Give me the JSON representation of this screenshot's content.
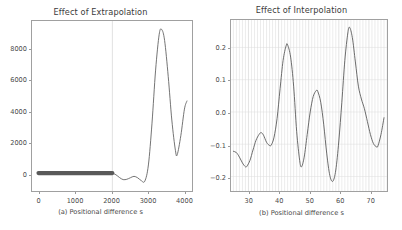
{
  "figure": {
    "background_color": "#ffffff",
    "axis_color": "#a0a0a0",
    "line_color": "#595959",
    "grid_color": "#d9d9d9",
    "panel_count": 2
  },
  "chart_data": [
    {
      "type": "line",
      "panel": "a",
      "title": "Effect of Extrapolation",
      "xlabel": "(a) Positional difference s",
      "ylabel": "",
      "xlim": [
        -180,
        4260
      ],
      "ylim": [
        -1150,
        9750
      ],
      "xticks": [
        0,
        1000,
        2000,
        3000,
        4000
      ],
      "xtick_labels": [
        "0",
        "1000",
        "2000",
        "3000",
        "4000"
      ],
      "yticks": [
        0,
        2000,
        4000,
        6000,
        8000
      ],
      "ytick_labels": [
        "0",
        "2000",
        "4000",
        "6000",
        "8000"
      ],
      "grid": "single vertical line at x=2050 marking train/extrapolation boundary",
      "gridlines_x": [
        2050
      ],
      "legend": "none",
      "annotations": [
        "thick flat band at y=0 from x=0 to x=2050 (training region, dense overlapping samples)",
        "extrapolation begins after x=2050: shallow negative ripple then steep blow-up"
      ],
      "x": [
        0,
        100,
        200,
        300,
        400,
        500,
        600,
        700,
        800,
        900,
        1000,
        1100,
        1200,
        1300,
        1400,
        1500,
        1600,
        1700,
        1800,
        1900,
        2000,
        2050,
        2150,
        2250,
        2350,
        2450,
        2550,
        2650,
        2750,
        2850,
        2950,
        3050,
        3150,
        3250,
        3350,
        3420,
        3500,
        3600,
        3700,
        3800,
        3850,
        3950,
        4050,
        4120
      ],
      "y": [
        0,
        0,
        0,
        0,
        0,
        0,
        0,
        0,
        0,
        0,
        0,
        0,
        0,
        0,
        0,
        0,
        0,
        0,
        0,
        0,
        0,
        0,
        -110,
        -290,
        -420,
        -400,
        -300,
        -210,
        -300,
        -480,
        -520,
        520,
        3200,
        6600,
        8900,
        9200,
        8500,
        6200,
        3400,
        1450,
        1180,
        2400,
        4100,
        4620
      ]
    },
    {
      "type": "line",
      "panel": "b",
      "title": "Effect of Interpolation",
      "xlabel": "(b) Positional difference s",
      "ylabel": "",
      "xlim": [
        24.2,
        76.0
      ],
      "ylim": [
        -0.245,
        0.285
      ],
      "xticks": [
        30,
        40,
        50,
        60,
        70
      ],
      "xtick_labels": [
        "30",
        "40",
        "50",
        "60",
        "70"
      ],
      "yticks": [
        -0.2,
        -0.1,
        0.0,
        0.1,
        0.2
      ],
      "ytick_labels": [
        "-0.2",
        "-0.1",
        "0.0",
        "0.1",
        "0.2"
      ],
      "grid": "dense vertical gridlines at every integer x (minor ticks)",
      "grid_spacing_x": 1,
      "legend": "none",
      "annotations": [
        "oscillating interpolation error curve",
        "major peaks near x=43 (0.21), x=52.5 (0.065), x=63.5 (0.26)",
        "major troughs near x=29.5 (-0.17), x=47.5 (-0.17), x=58 (-0.215)"
      ],
      "x": [
        25.0,
        26.0,
        27.0,
        28.0,
        29.0,
        29.5,
        30.5,
        31.5,
        32.5,
        33.5,
        34.2,
        35.0,
        36.0,
        37.0,
        37.6,
        38.5,
        39.5,
        40.5,
        41.5,
        42.5,
        43.0,
        44.0,
        45.0,
        46.0,
        47.0,
        47.6,
        48.5,
        49.5,
        50.5,
        51.5,
        52.5,
        53.0,
        54.0,
        55.0,
        56.0,
        57.0,
        58.0,
        59.0,
        60.0,
        61.0,
        62.0,
        63.0,
        63.6,
        64.5,
        65.5,
        66.5,
        67.5,
        68.5,
        69.5,
        70.5,
        71.5,
        72.5,
        73.0,
        74.0,
        75.0
      ],
      "y": [
        -0.122,
        -0.126,
        -0.14,
        -0.158,
        -0.17,
        -0.168,
        -0.15,
        -0.118,
        -0.088,
        -0.07,
        -0.064,
        -0.072,
        -0.094,
        -0.104,
        -0.102,
        -0.078,
        -0.02,
        0.072,
        0.16,
        0.205,
        0.208,
        0.17,
        0.08,
        -0.06,
        -0.15,
        -0.17,
        -0.14,
        -0.07,
        0.0,
        0.048,
        0.066,
        0.064,
        0.03,
        -0.04,
        -0.13,
        -0.196,
        -0.215,
        -0.18,
        -0.09,
        0.03,
        0.16,
        0.245,
        0.262,
        0.23,
        0.155,
        0.08,
        0.04,
        0.01,
        -0.03,
        -0.07,
        -0.098,
        -0.108,
        -0.105,
        -0.07,
        -0.018
      ]
    }
  ]
}
